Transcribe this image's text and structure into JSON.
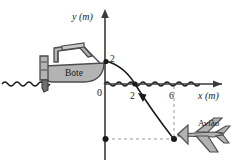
{
  "figure": {
    "name": "projectile-from-boat-diagram",
    "background_color": "#ffffff",
    "stroke_color": "#1a1a1a",
    "object_fill_color": "#b3b3b3",
    "object_stroke_color": "#4d4d4d",
    "dashed_color": "#8c8c8c"
  },
  "axes": {
    "x_label": "x (m)",
    "y_label": "y (m)",
    "origin_label": "0",
    "x_ticks": [
      {
        "label": "2",
        "value": 2
      },
      {
        "label": "6",
        "value": 6
      }
    ],
    "y_ticks": [
      {
        "label": "2",
        "value": 2
      }
    ],
    "origin_px": {
      "x": 105,
      "y": 84
    },
    "scale_px_per_unit": 11.5
  },
  "objects": {
    "boat": {
      "label": "Bote",
      "position_units": {
        "x": 0,
        "y": 2
      }
    },
    "airplane": {
      "label": "Avião",
      "position_units": {
        "x": 6,
        "y": -5
      }
    }
  },
  "trajectory": {
    "type": "parabola",
    "start_units": {
      "x": 0,
      "y": 2
    },
    "mid_units": {
      "x": 2,
      "y": 0
    },
    "end_units": {
      "x": 6,
      "y": -5
    },
    "direction": "downward-right",
    "has_arrowhead": true
  },
  "markers": {
    "launch_point": {
      "x": 0,
      "y": 2
    },
    "crossing_point": {
      "x": 2,
      "y": 0
    },
    "landing_point": {
      "x": 6,
      "y": -5
    },
    "y_axis_point": {
      "x": 0,
      "y": -5
    }
  },
  "guides": {
    "vertical_dashed_at_x": 6,
    "horizontal_dashed_at_y": -5
  },
  "water": {
    "style": "wavy-line",
    "at_y_units": 0
  }
}
